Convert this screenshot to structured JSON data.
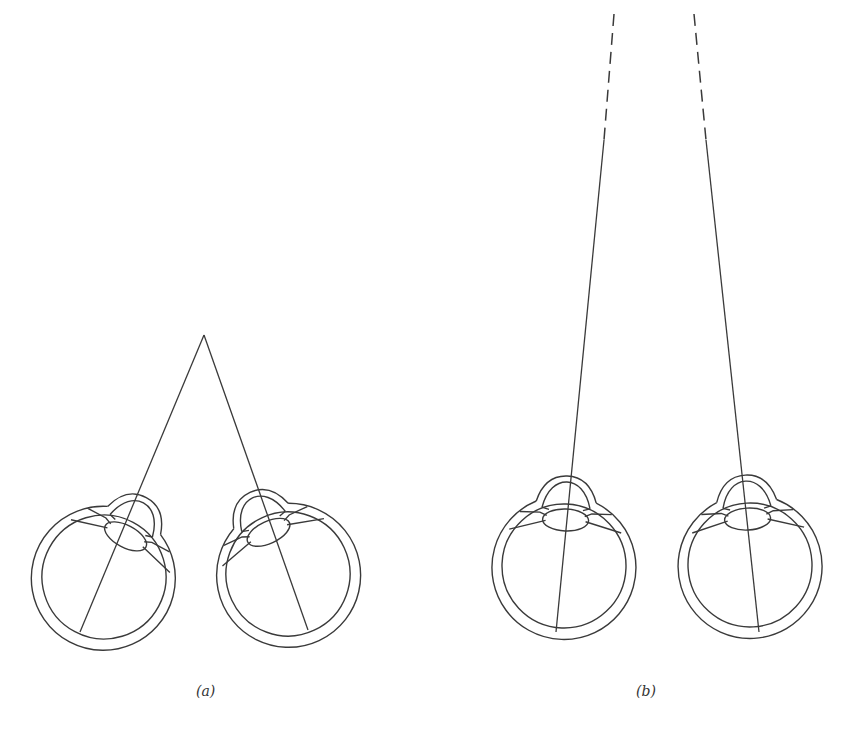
{
  "figure": {
    "panels": [
      {
        "id": "a",
        "label": "(a)",
        "description": "Two eyes converging on a near point",
        "fixation_point": {
          "x": 204,
          "y": 335
        },
        "eyes": [
          {
            "cx": 104,
            "cy": 577,
            "r_outer": 72,
            "r_inner": 62,
            "cornea_angle_deg": 28,
            "ray_end": {
              "x": 80,
              "y": 632
            }
          },
          {
            "cx": 288,
            "cy": 574,
            "r_outer": 72,
            "r_inner": 62,
            "cornea_angle_deg": -25,
            "ray_end": {
              "x": 308,
              "y": 630
            }
          }
        ]
      },
      {
        "id": "b",
        "label": "(b)",
        "description": "Two eyes with nearly parallel lines of sight to a distant point",
        "eyes": [
          {
            "cx": 564,
            "cy": 566,
            "r_outer": 73,
            "r_inner": 62,
            "cornea_angle_deg": 2,
            "ray_start": {
              "x": 614,
              "y": 14
            },
            "dash_end": {
              "x": 604,
              "y": 140
            },
            "ray_end": {
              "x": 556,
              "y": 632
            }
          },
          {
            "cx": 750,
            "cy": 565,
            "r_outer": 73,
            "r_inner": 62,
            "cornea_angle_deg": -3,
            "ray_start": {
              "x": 694,
              "y": 14
            },
            "dash_end": {
              "x": 706,
              "y": 140
            },
            "ray_end": {
              "x": 759,
              "y": 632
            }
          }
        ]
      }
    ],
    "stroke_color": "#3a3a3a",
    "background": "#ffffff"
  }
}
